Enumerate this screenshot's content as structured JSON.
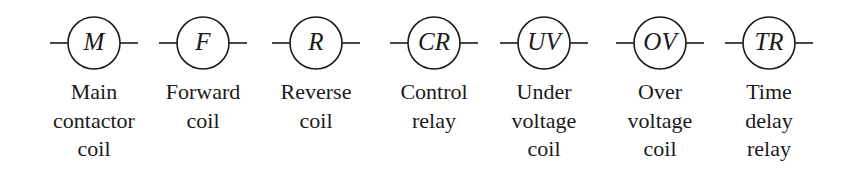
{
  "diagram": {
    "type": "electrical-coil-symbols",
    "symbols": [
      {
        "id": "M",
        "abbr": "M",
        "label_lines": [
          "Main",
          "contactor",
          "coil"
        ],
        "cx": 94
      },
      {
        "id": "F",
        "abbr": "F",
        "label_lines": [
          "Forward",
          "coil"
        ],
        "cx": 203
      },
      {
        "id": "R",
        "abbr": "R",
        "label_lines": [
          "Reverse",
          "coil"
        ],
        "cx": 316
      },
      {
        "id": "CR",
        "abbr": "CR",
        "label_lines": [
          "Control",
          "relay"
        ],
        "cx": 434
      },
      {
        "id": "UV",
        "abbr": "UV",
        "label_lines": [
          "Under",
          "voltage",
          "coil"
        ],
        "cx": 544
      },
      {
        "id": "OV",
        "abbr": "OV",
        "label_lines": [
          "Over",
          "voltage",
          "coil"
        ],
        "cx": 660
      },
      {
        "id": "TR",
        "abbr": "TR",
        "label_lines": [
          "Time",
          "delay",
          "relay"
        ],
        "cx": 769
      }
    ]
  },
  "style": {
    "stroke": "#1a1a1a",
    "background": "#ffffff"
  }
}
